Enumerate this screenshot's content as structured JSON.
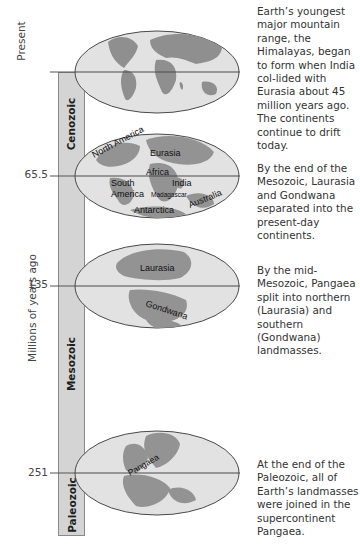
{
  "axis": {
    "title": "Millions of years ago",
    "present_label": "Present",
    "ticks": [
      {
        "label": "65.5",
        "value": 65.5
      },
      {
        "label": "135",
        "value": 135
      },
      {
        "label": "251",
        "value": 251
      }
    ]
  },
  "eras": [
    {
      "name": "Cenozoic"
    },
    {
      "name": "Mesozoic"
    },
    {
      "name": "Paleozoic"
    }
  ],
  "maps": [
    {
      "time": "Present",
      "labels": []
    },
    {
      "time": "65.5",
      "labels": [
        "North America",
        "Eurasia",
        "Africa",
        "South America",
        "India",
        "Madagascar",
        "Australia",
        "Antarctica"
      ]
    },
    {
      "time": "135",
      "labels": [
        "Laurasia",
        "Gondwana"
      ]
    },
    {
      "time": "251",
      "labels": [
        "Pangaea"
      ]
    }
  ],
  "descriptions": [
    "Earth’s youngest major mountain range, the Himalayas, began to form when India col-lided with Eurasia about 45 million years ago. The continents continue to drift today.",
    "By the end of the Mesozoic, Laurasia and Gondwana separated into the present-day continents.",
    "By the mid-Mesozoic, Pangaea split into northern (Laurasia) and southern (Gondwana) landmasses.",
    "At the end of the Paleozoic, all of Earth’s landmasses were joined in the supercontinent Pangaea."
  ],
  "colors": {
    "bar_fill": "#d4d4d4",
    "ocean": "#e4e4e4",
    "land": "#8c8c8c",
    "outline": "#4a4a4a"
  }
}
